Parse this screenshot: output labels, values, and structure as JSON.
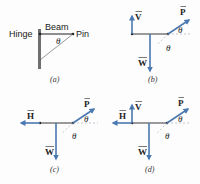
{
  "colors": {
    "beam": "#9a9a9a",
    "vector": "#4a78b0",
    "wall": "#6f6f6f",
    "text": "#222222",
    "dashed": "#9aa6b4"
  },
  "panel_a": {
    "hinge_label": "Hinge",
    "beam_label": "Beam",
    "pin_label": "Pin",
    "angle_label": "θ",
    "caption": "(a)"
  },
  "panel_b": {
    "vectors": [
      "V",
      "P",
      "W"
    ],
    "v_label": "V",
    "p_label": "P",
    "w_label": "W",
    "angle_label_1": "θ",
    "angle_label_2": "θ",
    "caption": "(b)"
  },
  "panel_c": {
    "vectors": [
      "H",
      "P",
      "W"
    ],
    "h_label": "H",
    "p_label": "P",
    "w_label": "W",
    "angle_label_1": "θ",
    "angle_label_2": "θ",
    "caption": "(c)"
  },
  "panel_d": {
    "vectors": [
      "H",
      "V",
      "P",
      "W"
    ],
    "h_label": "H",
    "v_label": "V",
    "p_label": "P",
    "w_label": "W",
    "angle_label_1": "θ",
    "angle_label_2": "θ",
    "caption": "(d)"
  }
}
